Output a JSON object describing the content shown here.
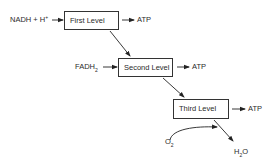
{
  "diagram": {
    "inputs": {
      "nadh": {
        "main": "NADH + H",
        "sup": "+"
      },
      "fadh": {
        "main": "FADH",
        "sub": "2"
      },
      "oxygen": {
        "main": "O",
        "sub": "2"
      }
    },
    "levels": [
      {
        "label": "First Level",
        "output": "ATP"
      },
      {
        "label": "Second Level",
        "output": "ATP"
      },
      {
        "label": "Third Level",
        "output": "ATP"
      }
    ],
    "product": {
      "main": "H",
      "sub": "2",
      "tail": "O"
    }
  }
}
